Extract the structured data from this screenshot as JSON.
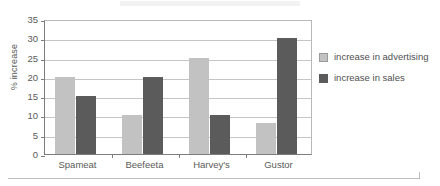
{
  "chart_data": {
    "type": "bar",
    "title": "",
    "xlabel": "",
    "ylabel": "% increase",
    "categories": [
      "Spameat",
      "Beefeeta",
      "Harvey's",
      "Gustor"
    ],
    "series": [
      {
        "name": "increase in advertising",
        "color": "#c2c2c2",
        "values": [
          20,
          10,
          25,
          8
        ]
      },
      {
        "name": "increase in sales",
        "color": "#5b5b5b",
        "values": [
          15,
          20,
          10,
          30
        ]
      }
    ],
    "ylim": [
      0,
      35
    ],
    "ytick_step": 5,
    "yticks": [
      0,
      5,
      10,
      15,
      20,
      25,
      30,
      35
    ],
    "grid": "horizontal",
    "legend_position": "right"
  },
  "legend": {
    "entries": [
      {
        "label": "increase in advertising",
        "icon": "legend-swatch-light"
      },
      {
        "label": "increase in sales",
        "icon": "legend-swatch-dark"
      }
    ]
  }
}
